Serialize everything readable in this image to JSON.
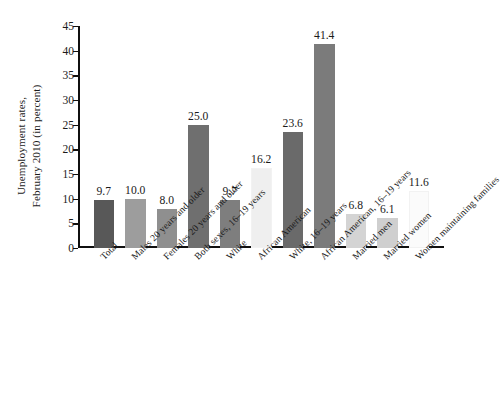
{
  "chart_data": {
    "type": "bar",
    "title": "",
    "subtitle": "",
    "xlabel": "",
    "ylabel_lines": [
      "Unemployment rates,",
      "February 2010 (in percent)"
    ],
    "ylabel": "Unemployment rates, February 2010 (in percent)",
    "ylim": [
      0,
      45
    ],
    "ytick_step": 5,
    "yticks": [
      "0",
      "5",
      "10",
      "15",
      "20",
      "25",
      "30",
      "35",
      "40",
      "45"
    ],
    "grid": false,
    "legend": false,
    "categories": [
      "Total",
      "Males 20 years and older",
      "Females 20 years and older",
      "Both sexes, 16–19 years",
      "White",
      "African American",
      "White, 16–19 years",
      "African American, 16–19 years",
      "Married men",
      "Married women",
      "Women maintaining families"
    ],
    "values": [
      9.7,
      10.0,
      8.0,
      25.0,
      9.7,
      16.2,
      23.6,
      41.4,
      6.8,
      6.1,
      11.6
    ],
    "value_labels": [
      "9.7",
      "10.0",
      "8.0",
      "25.0",
      "9.7",
      "16.2",
      "23.6",
      "41.4",
      "6.8",
      "6.1",
      "11.6"
    ],
    "bar_colors": [
      "#585858",
      "#9d9d9d",
      "#8f8f8f",
      "#6f6f6f",
      "#7e7e7e",
      "#efefef",
      "#6a6a6a",
      "#7b7b7b",
      "#d4d4d4",
      "#cfcfcf",
      "#fbfbfb"
    ],
    "axis_color": "#101010",
    "text_color": "#1a1a1a",
    "background": "#ffffff"
  }
}
